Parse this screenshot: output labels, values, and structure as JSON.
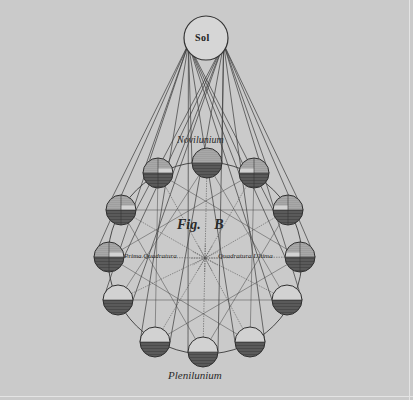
{
  "figure": {
    "title": "Fig. B",
    "fig_prefix": "Fig.",
    "fig_letter": "B",
    "colors": {
      "background": "#cacaca",
      "ink": "#2e2e2e",
      "shadow_fill": "#4a4a4a",
      "sun_fill": "#d6d6d6"
    }
  },
  "labels": {
    "sun": "Sol",
    "new_moon": "Novilunium",
    "first_quarter": "Prima Quadratura",
    "last_quarter": "Quadratura Ultima",
    "full_moon": "Plenilunium"
  },
  "sun": {
    "cx": 206,
    "cy": 38,
    "r": 22
  },
  "orbit": {
    "cx": 205,
    "cy": 258,
    "rx": 97,
    "ry": 96
  },
  "moons": [
    {
      "name": "novilunium",
      "cx": 207,
      "cy": 163,
      "phase": "new"
    },
    {
      "name": "upper-right-1",
      "cx": 254,
      "cy": 173,
      "phase": "crescent"
    },
    {
      "name": "upper-right-2",
      "cx": 288,
      "cy": 210,
      "phase": "crescent"
    },
    {
      "name": "quadratura-ultima",
      "cx": 300,
      "cy": 257,
      "phase": "quarter"
    },
    {
      "name": "lower-right-1",
      "cx": 287,
      "cy": 300,
      "phase": "gibbous"
    },
    {
      "name": "lower-right-2",
      "cx": 250,
      "cy": 342,
      "phase": "gibbous"
    },
    {
      "name": "plenilunium",
      "cx": 203,
      "cy": 352,
      "phase": "full"
    },
    {
      "name": "lower-left-2",
      "cx": 155,
      "cy": 342,
      "phase": "gibbous"
    },
    {
      "name": "lower-left-1",
      "cx": 118,
      "cy": 300,
      "phase": "gibbous"
    },
    {
      "name": "prima-quadratura",
      "cx": 109,
      "cy": 257,
      "phase": "quarter"
    },
    {
      "name": "upper-left-2",
      "cx": 121,
      "cy": 210,
      "phase": "crescent"
    },
    {
      "name": "upper-left-1",
      "cx": 158,
      "cy": 173,
      "phase": "crescent"
    }
  ],
  "moon_radius": 15
}
